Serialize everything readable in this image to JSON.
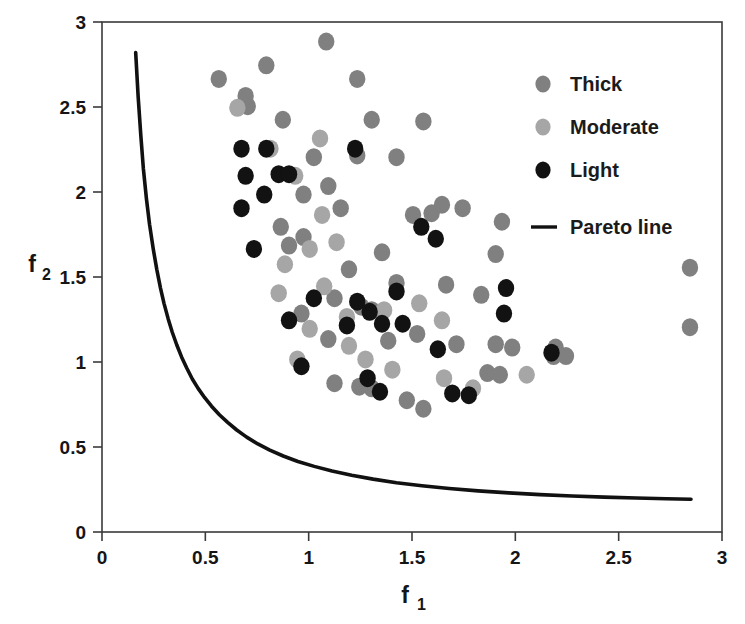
{
  "chart_data": {
    "type": "scatter",
    "title": "",
    "xlabel": "f1",
    "xlabel_base": "f",
    "xlabel_sub": "1",
    "ylabel": "f2",
    "ylabel_base": "f",
    "ylabel_sub": "2",
    "xlim": [
      0,
      3
    ],
    "ylim": [
      0,
      3
    ],
    "xticks": [
      0,
      0.5,
      1,
      1.5,
      2,
      2.5,
      3
    ],
    "xtick_labels": [
      "0",
      "0.5",
      "1",
      "1.5",
      "2",
      "2.5",
      "3"
    ],
    "yticks": [
      0,
      0.5,
      1,
      1.5,
      2,
      2.5,
      3
    ],
    "ytick_labels": [
      "0",
      "0.5",
      "1",
      "1.5",
      "2",
      "2.5",
      "3"
    ],
    "grid": false,
    "frame": true,
    "legend_position": "top-right",
    "legend": [
      {
        "label": "Thick",
        "marker": "circle",
        "color": "#808080"
      },
      {
        "label": "Moderate",
        "marker": "circle",
        "color": "#a6a6a6"
      },
      {
        "label": "Light",
        "marker": "circle",
        "color": "#121212"
      },
      {
        "label": "Pareto line",
        "marker": "line",
        "color": "#111111"
      }
    ],
    "series": [
      {
        "name": "Thick",
        "marker": "circle",
        "color": "#808080",
        "points": [
          [
            0.565,
            2.665
          ],
          [
            0.795,
            2.745
          ],
          [
            0.695,
            2.565
          ],
          [
            0.705,
            2.505
          ],
          [
            0.875,
            2.425
          ],
          [
            1.235,
            2.665
          ],
          [
            1.085,
            2.885
          ],
          [
            1.305,
            2.425
          ],
          [
            1.555,
            2.415
          ],
          [
            1.025,
            2.205
          ],
          [
            1.235,
            2.215
          ],
          [
            1.425,
            2.205
          ],
          [
            0.975,
            1.985
          ],
          [
            1.095,
            2.035
          ],
          [
            1.155,
            1.905
          ],
          [
            0.865,
            1.795
          ],
          [
            0.905,
            1.685
          ],
          [
            0.975,
            1.735
          ],
          [
            1.645,
            1.925
          ],
          [
            1.745,
            1.905
          ],
          [
            1.505,
            1.865
          ],
          [
            1.595,
            1.875
          ],
          [
            1.935,
            1.825
          ],
          [
            1.905,
            1.635
          ],
          [
            1.355,
            1.645
          ],
          [
            1.195,
            1.545
          ],
          [
            1.125,
            1.375
          ],
          [
            1.255,
            1.325
          ],
          [
            1.305,
            1.305
          ],
          [
            1.425,
            1.465
          ],
          [
            1.665,
            1.455
          ],
          [
            1.835,
            1.395
          ],
          [
            1.525,
            1.165
          ],
          [
            1.385,
            1.125
          ],
          [
            1.095,
            1.135
          ],
          [
            0.965,
            1.285
          ],
          [
            1.715,
            1.105
          ],
          [
            1.905,
            1.105
          ],
          [
            1.985,
            1.085
          ],
          [
            2.195,
            1.085
          ],
          [
            2.245,
            1.035
          ],
          [
            2.185,
            1.035
          ],
          [
            2.845,
            1.555
          ],
          [
            2.845,
            1.205
          ],
          [
            1.865,
            0.935
          ],
          [
            1.925,
            0.925
          ],
          [
            1.245,
            0.855
          ],
          [
            1.305,
            0.845
          ],
          [
            1.475,
            0.775
          ],
          [
            1.555,
            0.725
          ],
          [
            1.125,
            0.875
          ]
        ]
      },
      {
        "name": "Moderate",
        "marker": "circle",
        "color": "#a6a6a6",
        "points": [
          [
            0.655,
            2.495
          ],
          [
            0.815,
            2.255
          ],
          [
            1.055,
            2.315
          ],
          [
            0.935,
            2.095
          ],
          [
            1.065,
            1.865
          ],
          [
            0.885,
            1.575
          ],
          [
            1.005,
            1.665
          ],
          [
            1.135,
            1.705
          ],
          [
            0.855,
            1.405
          ],
          [
            1.075,
            1.445
          ],
          [
            1.005,
            1.195
          ],
          [
            1.185,
            1.265
          ],
          [
            1.365,
            1.305
          ],
          [
            1.645,
            1.245
          ],
          [
            1.275,
            1.015
          ],
          [
            1.405,
            0.955
          ],
          [
            1.195,
            1.095
          ],
          [
            1.655,
            0.905
          ],
          [
            1.795,
            0.845
          ],
          [
            2.055,
            0.925
          ],
          [
            0.945,
            1.015
          ],
          [
            1.535,
            1.345
          ]
        ]
      },
      {
        "name": "Light",
        "marker": "circle",
        "color": "#121212",
        "points": [
          [
            0.675,
            2.255
          ],
          [
            0.795,
            2.255
          ],
          [
            0.695,
            2.095
          ],
          [
            0.855,
            2.105
          ],
          [
            0.905,
            2.105
          ],
          [
            0.675,
            1.905
          ],
          [
            0.785,
            1.985
          ],
          [
            0.735,
            1.665
          ],
          [
            1.225,
            2.255
          ],
          [
            1.025,
            1.375
          ],
          [
            0.905,
            1.245
          ],
          [
            1.235,
            1.355
          ],
          [
            1.295,
            1.295
          ],
          [
            1.185,
            1.215
          ],
          [
            1.425,
            1.415
          ],
          [
            1.355,
            1.225
          ],
          [
            1.545,
            1.795
          ],
          [
            1.615,
            1.725
          ],
          [
            1.955,
            1.435
          ],
          [
            1.945,
            1.285
          ],
          [
            1.455,
            1.225
          ],
          [
            1.625,
            1.075
          ],
          [
            0.965,
            0.975
          ],
          [
            1.345,
            0.825
          ],
          [
            1.695,
            0.815
          ],
          [
            1.775,
            0.805
          ],
          [
            2.175,
            1.055
          ],
          [
            1.285,
            0.905
          ]
        ]
      }
    ],
    "pareto_line": {
      "name": "Pareto line",
      "color": "#111111",
      "width": 3.6,
      "points": [
        [
          0.163,
          2.82
        ],
        [
          0.175,
          2.56
        ],
        [
          0.188,
          2.33
        ],
        [
          0.2,
          2.14
        ],
        [
          0.215,
          1.96
        ],
        [
          0.23,
          1.81
        ],
        [
          0.248,
          1.665
        ],
        [
          0.265,
          1.545
        ],
        [
          0.283,
          1.435
        ],
        [
          0.3,
          1.345
        ],
        [
          0.32,
          1.255
        ],
        [
          0.34,
          1.175
        ],
        [
          0.362,
          1.1
        ],
        [
          0.385,
          1.03
        ],
        [
          0.41,
          0.965
        ],
        [
          0.437,
          0.9
        ],
        [
          0.465,
          0.845
        ],
        [
          0.497,
          0.79
        ],
        [
          0.53,
          0.74
        ],
        [
          0.568,
          0.69
        ],
        [
          0.608,
          0.645
        ],
        [
          0.652,
          0.6
        ],
        [
          0.7,
          0.558
        ],
        [
          0.754,
          0.518
        ],
        [
          0.812,
          0.482
        ],
        [
          0.877,
          0.447
        ],
        [
          0.948,
          0.415
        ],
        [
          1.027,
          0.386
        ],
        [
          1.113,
          0.359
        ],
        [
          1.208,
          0.334
        ],
        [
          1.312,
          0.311
        ],
        [
          1.425,
          0.29
        ],
        [
          1.548,
          0.272
        ],
        [
          1.68,
          0.256
        ],
        [
          1.82,
          0.242
        ],
        [
          1.968,
          0.23
        ],
        [
          2.12,
          0.22
        ],
        [
          2.275,
          0.212
        ],
        [
          2.43,
          0.205
        ],
        [
          2.585,
          0.2
        ],
        [
          2.73,
          0.196
        ],
        [
          2.85,
          0.193
        ]
      ]
    }
  }
}
